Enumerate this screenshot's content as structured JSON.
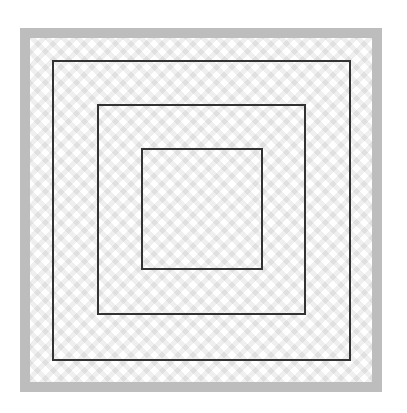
{
  "diagram": {
    "frame": {
      "color": "#bdbdbd",
      "thickness": 10
    },
    "background_pattern": "light gray zigzag chevron",
    "squares": [
      {
        "name": "outer",
        "x": 52,
        "y": 60,
        "w": 298,
        "h": 300,
        "stroke": "#333333"
      },
      {
        "name": "middle",
        "x": 97,
        "y": 104,
        "w": 208,
        "h": 210,
        "stroke": "#333333"
      },
      {
        "name": "inner",
        "x": 141,
        "y": 148,
        "w": 121,
        "h": 121,
        "stroke": "#333333"
      }
    ]
  }
}
